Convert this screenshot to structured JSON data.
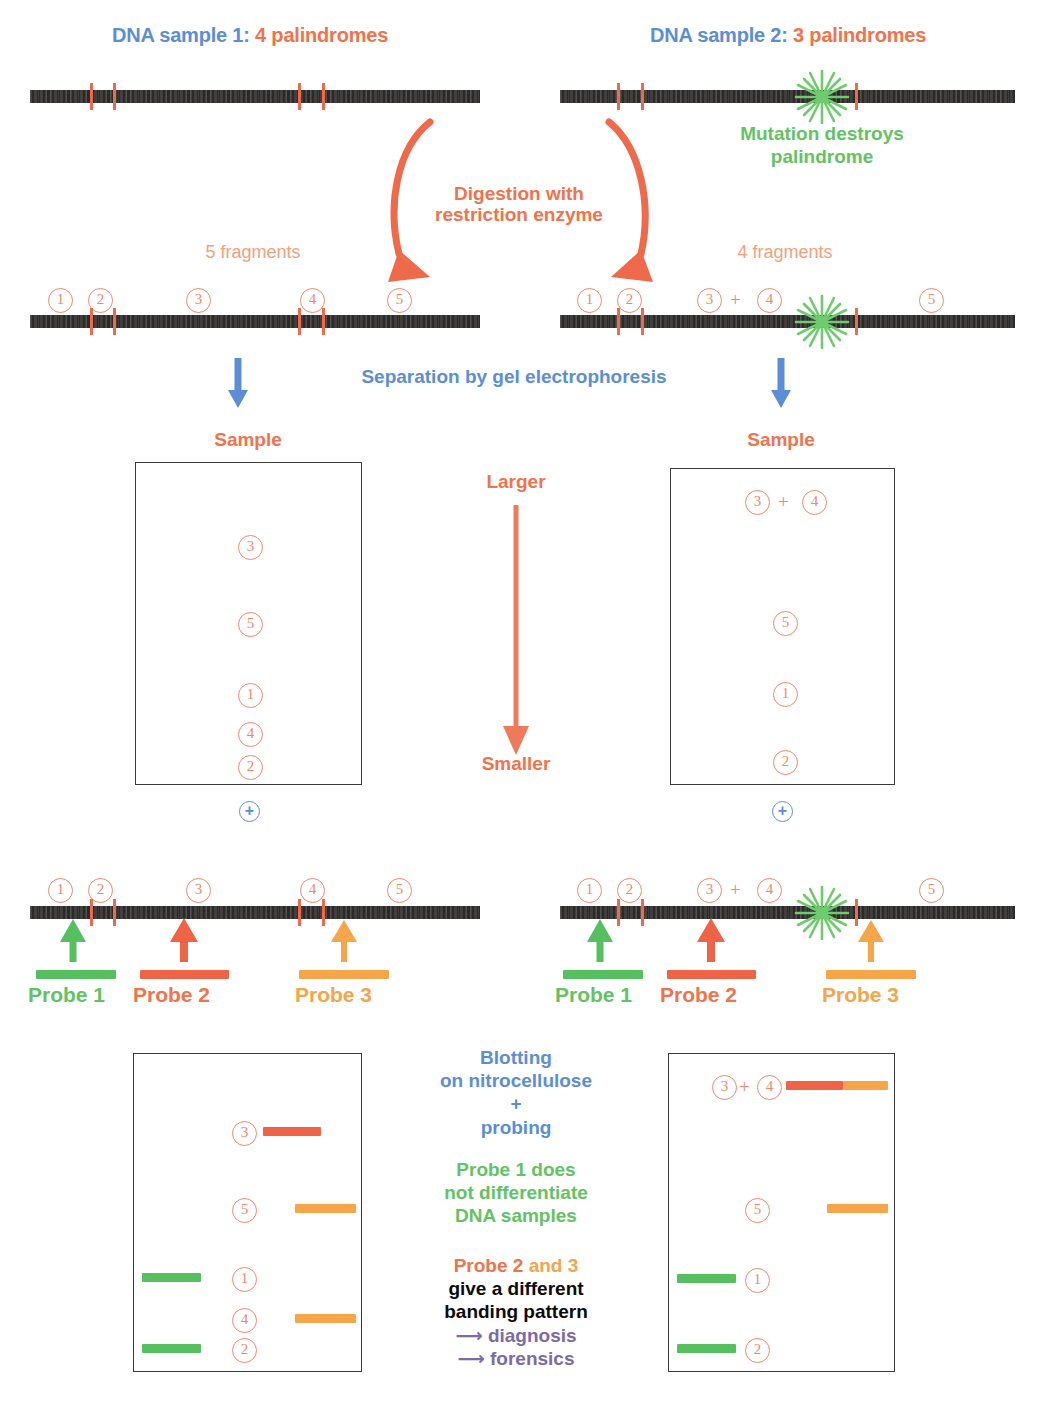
{
  "colors": {
    "blue": "#5b8ed6",
    "orange": "#f2724b",
    "green": "#63c364",
    "amber": "#f5a54a",
    "purple": "#7c6ba8",
    "dna": "#2b2a28",
    "cut": "#ef6a4a",
    "circle_num": "#f0896a"
  },
  "headers": {
    "sample1_prefix": "DNA sample 1:",
    "sample1_count": "4 palindromes",
    "sample2_prefix": "DNA sample 2:",
    "sample2_count": "3 palindromes"
  },
  "mutation": {
    "line1": "Mutation destroys",
    "line2": "palindrome"
  },
  "digestion": {
    "line1": "Digestion with",
    "line2": "restriction enzyme"
  },
  "fragments": {
    "left_count": "5 fragments",
    "right_count": "4 fragments",
    "left_labels": [
      "1",
      "2",
      "3",
      "4",
      "5"
    ],
    "right_labels": [
      "1",
      "2",
      "3",
      "4",
      "5"
    ],
    "right_plus": "+"
  },
  "electrophoresis": {
    "caption": "Separation by gel electrophoresis",
    "sample_label_left": "Sample",
    "sample_label_right": "Sample",
    "larger": "Larger",
    "smaller": "Smaller",
    "anode_symbol": "+"
  },
  "gel_left": {
    "lanes": [
      {
        "label": "3",
        "y": 545
      },
      {
        "label": "5",
        "y": 622
      },
      {
        "label": "1",
        "y": 693
      },
      {
        "label": "4",
        "y": 732
      },
      {
        "label": "2",
        "y": 765
      }
    ]
  },
  "gel_right": {
    "lanes": [
      {
        "label": "3",
        "plus": "+",
        "label2": "4",
        "y": 500
      },
      {
        "label": "5",
        "y": 621
      },
      {
        "label": "1",
        "y": 692
      },
      {
        "label": "2",
        "y": 760
      }
    ]
  },
  "probes": {
    "items": [
      {
        "name": "Probe 1",
        "color": "#56bf5f"
      },
      {
        "name": "Probe 2",
        "color": "#ef6347"
      },
      {
        "name": "Probe 3",
        "color": "#f5a54a"
      }
    ]
  },
  "blotting": {
    "line1": "Blotting",
    "line2": "on nitrocellulose",
    "line3": "+",
    "line4": "probing"
  },
  "probe1_note": {
    "line1": "Probe 1 does",
    "line2": "not differentiate",
    "line3": "DNA samples"
  },
  "probe23_note": {
    "prefix": "Probe 2",
    "mid": " and ",
    "suffix": "3",
    "line2": "give a different",
    "line3": "banding pattern",
    "bullet1": "diagnosis",
    "bullet2": "forensics",
    "arrow_glyph": "⟶"
  },
  "blot_left": {
    "rows": [
      {
        "label": "3",
        "y": 1131,
        "band": "red",
        "side": "right"
      },
      {
        "label": "5",
        "y": 1208,
        "band": "orange",
        "side": "right"
      },
      {
        "label": "1",
        "y": 1277,
        "band": "green",
        "side": "left"
      },
      {
        "label": "4",
        "y": 1318,
        "band": "orange",
        "side": "right"
      },
      {
        "label": "2",
        "y": 1348,
        "band": "green",
        "side": "left"
      }
    ]
  },
  "blot_right": {
    "rows": [
      {
        "label": "3",
        "plus": "+",
        "label2": "4",
        "y": 1085,
        "band": "red+orange",
        "side": "right"
      },
      {
        "label": "5",
        "y": 1208,
        "band": "orange",
        "side": "right"
      },
      {
        "label": "1",
        "y": 1278,
        "band": "green",
        "side": "left"
      },
      {
        "label": "2",
        "y": 1348,
        "band": "green",
        "side": "left"
      }
    ]
  }
}
